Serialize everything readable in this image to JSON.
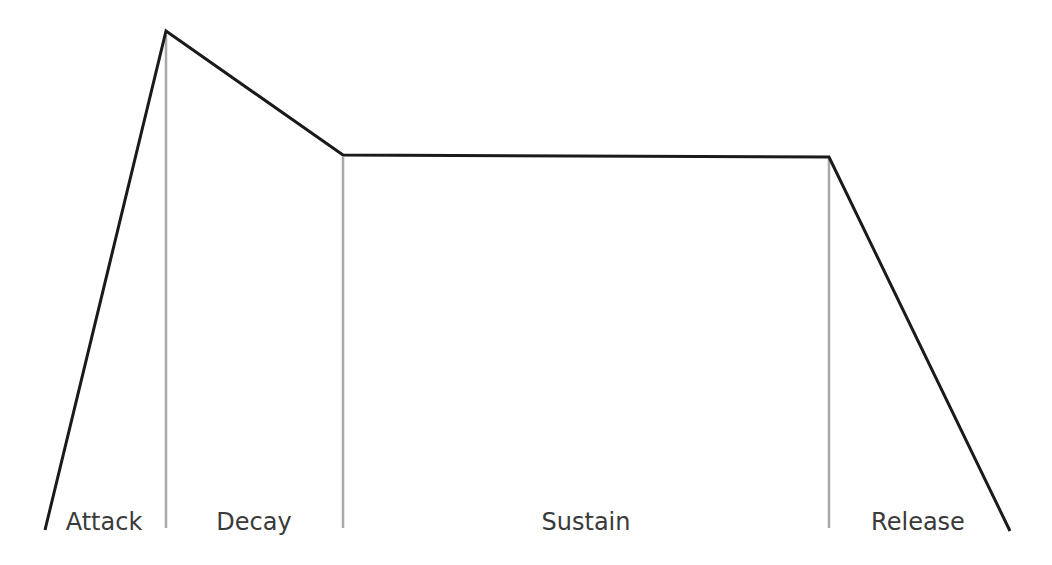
{
  "diagram": {
    "type": "adsr-envelope",
    "colors": {
      "envelope": "#1a1a1a",
      "divider": "#a8a8a8",
      "label": "#3a3a3a",
      "background": "#ffffff"
    },
    "points": {
      "start": [
        45,
        530
      ],
      "peak": [
        166,
        31
      ],
      "decay_end": [
        343,
        155
      ],
      "sustain_end": [
        829,
        157
      ],
      "release_end": [
        1010,
        531
      ]
    },
    "phases": [
      {
        "label": "Attack",
        "x": 104
      },
      {
        "label": "Decay",
        "x": 254
      },
      {
        "label": "Sustain",
        "x": 586
      },
      {
        "label": "Release",
        "x": 918
      }
    ]
  }
}
